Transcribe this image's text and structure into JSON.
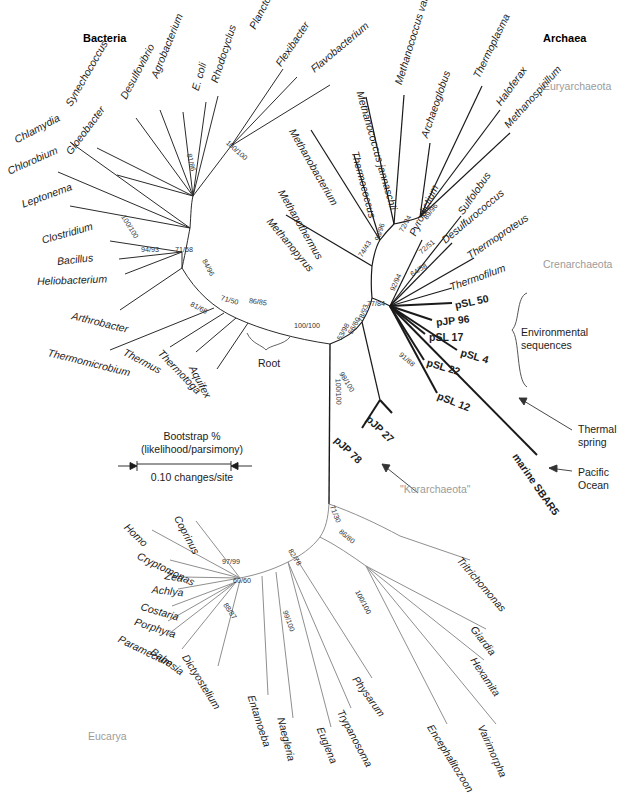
{
  "figure": {
    "line_color_bacteria": "#2b2b2b",
    "line_color_archaea": "#1a1a1a",
    "line_color_eucarya": "#8f8f8f",
    "group_label_color": "#9b9b9b",
    "background": "#ffffff"
  },
  "domains": [
    {
      "name": "Bacteria",
      "x": 83,
      "y": 32
    },
    {
      "name": "Archaea",
      "x": 543,
      "y": 32
    }
  ],
  "groups": [
    {
      "name": "Euryarchaeota",
      "x": 543,
      "y": 80
    },
    {
      "name": "Crenarchaeota",
      "x": 543,
      "y": 258
    },
    {
      "name": "Eucarya",
      "x": 88,
      "y": 730
    },
    {
      "name": "\"Korarchaeota\"",
      "x": 400,
      "y": 489
    }
  ],
  "legend": {
    "line1": "Bootstrap %",
    "line2": "(likelihood/parsimony)",
    "scale": "0.10 changes/site",
    "x": 118,
    "y": 430,
    "width": 148
  },
  "root_label": {
    "text": "Root",
    "x": 258,
    "y": 357
  },
  "annotations": [
    {
      "name": "environmental-sequences",
      "line1": "Environmental",
      "line2": "sequences",
      "x": 521,
      "y": 333
    },
    {
      "name": "thermal-spring",
      "line1": "Thermal",
      "line2": "spring",
      "x": 578,
      "y": 428
    },
    {
      "name": "pacific-ocean",
      "line1": "Pacific",
      "line2": "Ocean",
      "x": 578,
      "y": 476
    }
  ],
  "taxa_bacteria": [
    {
      "label": "Chlamydia",
      "x": 15,
      "y": 135,
      "rot": -28,
      "style": "ital"
    },
    {
      "label": "Chlorobium",
      "x": 8,
      "y": 166,
      "rot": -24,
      "style": "ital"
    },
    {
      "label": "Leptonema",
      "x": 22,
      "y": 199,
      "rot": -20,
      "style": "ital"
    },
    {
      "label": "Clostridium",
      "x": 42,
      "y": 235,
      "rot": -16,
      "style": "ital"
    },
    {
      "label": "Bacillus",
      "x": 57,
      "y": 256,
      "rot": -6,
      "style": "ital"
    },
    {
      "label": "Heliobacterium",
      "x": 37,
      "y": 276,
      "rot": -2,
      "style": "ital"
    },
    {
      "label": "Arthrobacter",
      "x": 72,
      "y": 310,
      "rot": 14,
      "style": "ital"
    },
    {
      "label": "Thermomicrobium",
      "x": 48,
      "y": 347,
      "rot": 14,
      "style": "ital"
    },
    {
      "label": "Thermus",
      "x": 124,
      "y": 346,
      "rot": 28,
      "style": "ital"
    },
    {
      "label": "Thermotoga",
      "x": 160,
      "y": 346,
      "rot": 46,
      "style": "ital"
    },
    {
      "label": "Aquifex",
      "x": 192,
      "y": 361,
      "rot": 62,
      "style": "ital"
    },
    {
      "label": "Gloeobacter",
      "x": 68,
      "y": 148,
      "rot": -53,
      "style": "ital"
    },
    {
      "label": "Synechococcus",
      "x": 68,
      "y": 100,
      "rot": -60,
      "style": "ital"
    },
    {
      "label": "Desulfovibrio",
      "x": 123,
      "y": 93,
      "rot": -62,
      "style": "ital"
    },
    {
      "label": "Agrobacterium",
      "x": 154,
      "y": 72,
      "rot": -68,
      "style": "ital"
    },
    {
      "label": "E. coli",
      "x": 195,
      "y": 85,
      "rot": -74,
      "style": "ital"
    },
    {
      "label": "Rhodocyclus",
      "x": 214,
      "y": 77,
      "rot": -72,
      "style": "ital"
    },
    {
      "label": "Planctomyces",
      "x": 252,
      "y": 23,
      "rot": -63,
      "style": "ital"
    },
    {
      "label": "Flexibacter",
      "x": 278,
      "y": 60,
      "rot": -56,
      "style": "ital"
    },
    {
      "label": "Flavobacterium",
      "x": 312,
      "y": 65,
      "rot": -40,
      "style": "ital"
    }
  ],
  "taxa_archaea": [
    {
      "label": "Methanobacterium",
      "x": 292,
      "y": 124,
      "rot": 60,
      "style": "ital"
    },
    {
      "label": "Methanothermus",
      "x": 281,
      "y": 185,
      "rot": 60,
      "style": "ital"
    },
    {
      "label": "Methanopyrus",
      "x": 269,
      "y": 214,
      "rot": 50,
      "style": "ital"
    },
    {
      "label": "Thermococcus",
      "x": 355,
      "y": 146,
      "rot": 75,
      "style": "ital"
    },
    {
      "label": "Methanococcus jannaschii",
      "x": 360,
      "y": 86,
      "rot": 74,
      "style": "ital"
    },
    {
      "label": "Methanococcus vannielii",
      "x": 398,
      "y": 79,
      "rot": -73,
      "style": "ital"
    },
    {
      "label": "Archaeoglobus",
      "x": 424,
      "y": 132,
      "rot": -71,
      "style": "ital"
    },
    {
      "label": "Thermoplasma",
      "x": 476,
      "y": 72,
      "rot": -64,
      "style": "ital"
    },
    {
      "label": "Haloferax",
      "x": 498,
      "y": 99,
      "rot": -54,
      "style": "ital"
    },
    {
      "label": "Methanospirillum",
      "x": 506,
      "y": 121,
      "rot": -48,
      "style": "ital"
    },
    {
      "label": "Pyrodictium",
      "x": 412,
      "y": 230,
      "rot": -65,
      "style": "ital"
    },
    {
      "label": "Sulfolobus",
      "x": 460,
      "y": 208,
      "rot": -55,
      "style": "ital"
    },
    {
      "label": "Desulfurococcus",
      "x": 443,
      "y": 236,
      "rot": -40,
      "style": "ital"
    },
    {
      "label": "Thermoproteus",
      "x": 468,
      "y": 251,
      "rot": -34,
      "style": "ital"
    },
    {
      "label": "Thermofilum",
      "x": 450,
      "y": 282,
      "rot": -20,
      "style": "ital"
    }
  ],
  "taxa_env": [
    {
      "label": "pSL 50",
      "x": 455,
      "y": 300,
      "rot": -12,
      "style": "bold"
    },
    {
      "label": "pJP 96",
      "x": 436,
      "y": 317,
      "rot": -6,
      "style": "bold"
    },
    {
      "label": "pSL 17",
      "x": 429,
      "y": 332,
      "rot": 0,
      "style": "bold"
    },
    {
      "label": "pSL 4",
      "x": 461,
      "y": 347,
      "rot": 16,
      "style": "bold"
    },
    {
      "label": "pSL 22",
      "x": 427,
      "y": 357,
      "rot": 16,
      "style": "bold"
    },
    {
      "label": "pSL 12",
      "x": 438,
      "y": 390,
      "rot": 22,
      "style": "bold"
    },
    {
      "label": "pJP 27",
      "x": 368,
      "y": 412,
      "rot": 44,
      "style": "bold"
    },
    {
      "label": "pJP 78",
      "x": 336,
      "y": 433,
      "rot": 44,
      "style": "bold"
    },
    {
      "label": "marine SBAR5",
      "x": 515,
      "y": 449,
      "rot": 55,
      "style": "bold"
    }
  ],
  "taxa_eucarya": [
    {
      "label": "Homo",
      "x": 126,
      "y": 520,
      "rot": 44,
      "style": "ital"
    },
    {
      "label": "Coprinus",
      "x": 177,
      "y": 511,
      "rot": 62,
      "style": "ital"
    },
    {
      "label": "Cryptomonas",
      "x": 138,
      "y": 550,
      "rot": 26,
      "style": "ital"
    },
    {
      "label": "Zea",
      "x": 165,
      "y": 570,
      "rot": 10,
      "style": "ital"
    },
    {
      "label": "Achlya",
      "x": 152,
      "y": 584,
      "rot": 6,
      "style": "ital"
    },
    {
      "label": "Costaria",
      "x": 141,
      "y": 601,
      "rot": 16,
      "style": "ital"
    },
    {
      "label": "Porphyra",
      "x": 135,
      "y": 616,
      "rot": 18,
      "style": "ital"
    },
    {
      "label": "Paramecium",
      "x": 119,
      "y": 633,
      "rot": 26,
      "style": "ital"
    },
    {
      "label": "Babesia",
      "x": 152,
      "y": 645,
      "rot": 36,
      "style": "ital"
    },
    {
      "label": "Dictyostelium",
      "x": 185,
      "y": 650,
      "rot": 58,
      "style": "ital"
    },
    {
      "label": "Entamoeba",
      "x": 251,
      "y": 690,
      "rot": 72,
      "style": "ital"
    },
    {
      "label": "Naegleria",
      "x": 281,
      "y": 712,
      "rot": 76,
      "style": "ital"
    },
    {
      "label": "Euglena",
      "x": 320,
      "y": 722,
      "rot": 68,
      "style": "ital"
    },
    {
      "label": "Trypanosoma",
      "x": 340,
      "y": 705,
      "rot": 62,
      "style": "ital"
    },
    {
      "label": "Physarum",
      "x": 355,
      "y": 672,
      "rot": 54,
      "style": "ital"
    },
    {
      "label": "Encephalitozoon",
      "x": 430,
      "y": 720,
      "rot": 58,
      "style": "ital"
    },
    {
      "label": "Vairimorpha",
      "x": 481,
      "y": 720,
      "rot": 66,
      "style": "ital"
    },
    {
      "label": "Hexamita",
      "x": 473,
      "y": 653,
      "rot": 56,
      "style": "ital"
    },
    {
      "label": "Giardia",
      "x": 473,
      "y": 622,
      "rot": 52,
      "style": "ital"
    },
    {
      "label": "Tritrichomonas",
      "x": 459,
      "y": 553,
      "rot": 49,
      "style": "ital"
    }
  ],
  "bootstraps": [
    {
      "value": "100/100",
      "x": 123,
      "y": 212,
      "rot": 58
    },
    {
      "value": "94/93",
      "x": 141,
      "y": 246,
      "rot": 0
    },
    {
      "value": "71/58",
      "x": 175,
      "y": 246,
      "rot": 0
    },
    {
      "value": "81/86",
      "x": 189,
      "y": 150,
      "rot": 76
    },
    {
      "value": "100/100",
      "x": 227,
      "y": 138,
      "rot": 42
    },
    {
      "value": "84/96",
      "x": 204,
      "y": 256,
      "rot": 62
    },
    {
      "value": "81/68",
      "x": 191,
      "y": 300,
      "rot": 28
    },
    {
      "value": "71/50",
      "x": 221,
      "y": 294,
      "rot": 16
    },
    {
      "value": "86/85",
      "x": 249,
      "y": 297,
      "rot": 8
    },
    {
      "value": "100/100",
      "x": 294,
      "y": 322,
      "rot": 0
    },
    {
      "value": "53/98",
      "x": 339,
      "y": 336,
      "rot": -62
    },
    {
      "value": "56/60",
      "x": 350,
      "y": 330,
      "rot": -62
    },
    {
      "value": "78/93",
      "x": 360,
      "y": 318,
      "rot": -70
    },
    {
      "value": "77/84",
      "x": 367,
      "y": 300,
      "rot": 0
    },
    {
      "value": "74/43",
      "x": 360,
      "y": 253,
      "rot": -58
    },
    {
      "value": "98/96",
      "x": 377,
      "y": 237,
      "rot": -72
    },
    {
      "value": "72/94",
      "x": 401,
      "y": 228,
      "rot": -62
    },
    {
      "value": "89/96",
      "x": 425,
      "y": 215,
      "rot": -52
    },
    {
      "value": "92/94",
      "x": 392,
      "y": 287,
      "rot": -66
    },
    {
      "value": "72/51",
      "x": 420,
      "y": 249,
      "rot": -40
    },
    {
      "value": "64/58",
      "x": 411,
      "y": 271,
      "rot": -32
    },
    {
      "value": "91/88",
      "x": 400,
      "y": 350,
      "rot": 40
    },
    {
      "value": "98/100",
      "x": 341,
      "y": 369,
      "rot": 58
    },
    {
      "value": "100/100",
      "x": 338,
      "y": 375,
      "rot": 88
    },
    {
      "value": "71/30",
      "x": 332,
      "y": 502,
      "rot": 68
    },
    {
      "value": "82/78",
      "x": 290,
      "y": 546,
      "rot": 58
    },
    {
      "value": "86/80",
      "x": 340,
      "y": 527,
      "rot": 40
    },
    {
      "value": "100/100",
      "x": 357,
      "y": 587,
      "rot": 62
    },
    {
      "value": "99/100",
      "x": 285,
      "y": 607,
      "rot": 70
    },
    {
      "value": "97/99",
      "x": 222,
      "y": 558,
      "rot": 0
    },
    {
      "value": "60/60",
      "x": 233,
      "y": 577,
      "rot": 0
    },
    {
      "value": "88/87",
      "x": 225,
      "y": 600,
      "rot": 56
    }
  ]
}
